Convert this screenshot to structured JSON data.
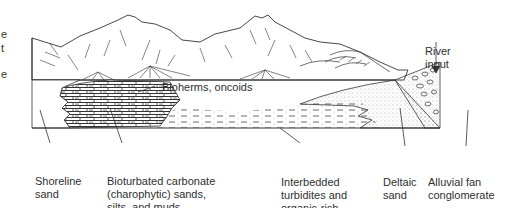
{
  "figure": {
    "type": "geological cross-section diagram"
  },
  "cropped_left_text": [
    "e",
    "t",
    "e"
  ],
  "labels": {
    "river_input": [
      "River",
      "input"
    ],
    "bioherms": "Bioherms, oncoids",
    "shoreline_sand": [
      "Shoreline",
      "sand"
    ],
    "bioturbated": [
      "Bioturbated carbonate",
      "(charophytic) sands,",
      "silts, and muds"
    ],
    "interbedded": [
      "Interbedded",
      "turbidites and",
      "organic-rich,",
      "limy mudstones"
    ],
    "deltaic_sand": [
      "Deltaic",
      "sand"
    ],
    "alluvial_fan": [
      "Alluvial fan",
      "conglomerate"
    ]
  },
  "colors": {
    "line": "#2a2a2a",
    "text": "#2f2f2f",
    "background": "#ffffff"
  }
}
